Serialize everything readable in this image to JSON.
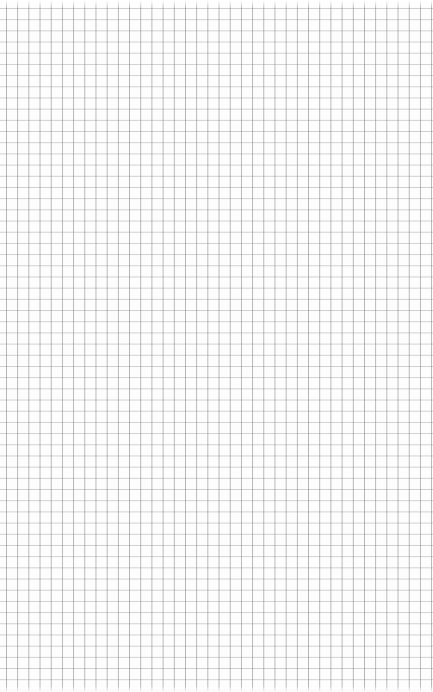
{
  "page": {
    "type": "graph-paper",
    "grid": {
      "cell_size_px": 11.2,
      "line_color": "#8a8a8a",
      "background_color": "#fdfdfd"
    }
  }
}
